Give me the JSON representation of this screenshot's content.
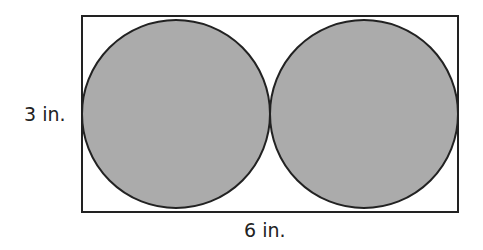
{
  "diagram": {
    "labels": {
      "height": "3 in.",
      "width": "6 in."
    },
    "rectangle": {
      "x": 82,
      "y": 16,
      "width": 376,
      "height": 196,
      "stroke": "#222222"
    },
    "circles": [
      {
        "cx": 176,
        "cy": 114,
        "r": 94,
        "fill": "#ababab"
      },
      {
        "cx": 364,
        "cy": 114,
        "r": 94,
        "fill": "#ababab"
      }
    ],
    "colors": {
      "fill": "#ababab",
      "stroke": "#222222",
      "background": "#ffffff"
    }
  }
}
